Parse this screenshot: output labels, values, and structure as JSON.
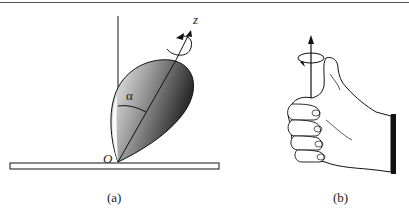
{
  "figure": {
    "panels": [
      {
        "id": "a",
        "caption": "(a)",
        "description": "Spinning top tilted at angle alpha from the vertical, pivoting at point O on a horizontal plate, rotating about its z axis",
        "labels": {
          "axis": "z",
          "angle": "α",
          "origin": "O"
        }
      },
      {
        "id": "b",
        "caption": "(b)",
        "description": "Right-hand rule: curled fingers show rotation direction, thumb points along the axis arrow",
        "labels": {}
      }
    ],
    "colors": {
      "line": "#111111",
      "shade_light": "#f4f4f4",
      "shade_dark": "#2a2a2a",
      "cuff": "#111111"
    }
  }
}
